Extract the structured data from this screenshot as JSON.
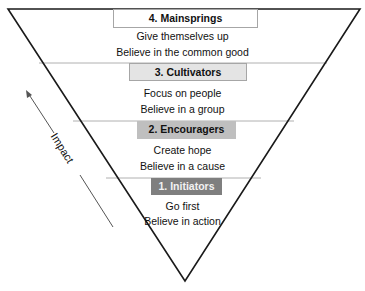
{
  "diagram": {
    "type": "inverted-pyramid",
    "colors": {
      "outline": "#1a1a1a",
      "divider": "#a6a6a6",
      "level4_fill": "#ffffff",
      "level3_fill": "#e4e4e4",
      "level2_fill": "#bfbfbf",
      "level1_fill": "#7f7f7f",
      "level1_text": "#f2f2f2"
    },
    "levels": [
      {
        "title": "4. Mainsprings",
        "line1": "Give themselves up",
        "line2": "Believe in the common good"
      },
      {
        "title": "3. Cultivators",
        "line1": "Focus on people",
        "line2": "Believe in a group"
      },
      {
        "title": "2. Encouragers",
        "line1": "Create hope",
        "line2": "Believe in a cause"
      },
      {
        "title": "1. Initiators",
        "line1": "Go first",
        "line2": "Believe in action"
      }
    ],
    "axis": {
      "label": "Impact",
      "direction": "up-left-arrow"
    }
  }
}
